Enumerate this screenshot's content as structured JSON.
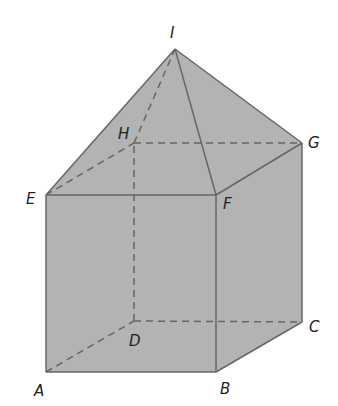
{
  "diagram": {
    "type": "solid-geometry",
    "colors": {
      "fill": "#b3b3b3",
      "edge": "#666666",
      "label": "#222222",
      "background": "#ffffff"
    },
    "points": {
      "A": {
        "x": 46,
        "y": 372,
        "label": "A",
        "lx": 34,
        "ly": 396
      },
      "B": {
        "x": 216,
        "y": 372,
        "label": "B",
        "lx": 220,
        "ly": 394
      },
      "C": {
        "x": 302,
        "y": 322,
        "label": "C",
        "lx": 309,
        "ly": 332
      },
      "D": {
        "x": 134,
        "y": 321,
        "label": "D",
        "lx": 129,
        "ly": 346
      },
      "E": {
        "x": 46,
        "y": 195,
        "label": "E",
        "lx": 26,
        "ly": 204
      },
      "F": {
        "x": 216,
        "y": 195,
        "label": "F",
        "lx": 223,
        "ly": 209
      },
      "G": {
        "x": 302,
        "y": 143,
        "label": "G",
        "lx": 308,
        "ly": 148
      },
      "H": {
        "x": 134,
        "y": 143,
        "label": "H",
        "lx": 118,
        "ly": 139
      },
      "I": {
        "x": 175,
        "y": 49,
        "label": "I",
        "lx": 170,
        "ly": 38
      }
    },
    "visible_edges": [
      [
        "A",
        "B"
      ],
      [
        "B",
        "C"
      ],
      [
        "C",
        "G"
      ],
      [
        "A",
        "E"
      ],
      [
        "B",
        "F"
      ],
      [
        "E",
        "F"
      ],
      [
        "F",
        "G"
      ],
      [
        "E",
        "I"
      ],
      [
        "F",
        "I"
      ],
      [
        "G",
        "I"
      ]
    ],
    "hidden_edges": [
      [
        "A",
        "D"
      ],
      [
        "D",
        "C"
      ],
      [
        "D",
        "H"
      ],
      [
        "E",
        "H"
      ],
      [
        "H",
        "G"
      ],
      [
        "H",
        "I"
      ]
    ]
  }
}
